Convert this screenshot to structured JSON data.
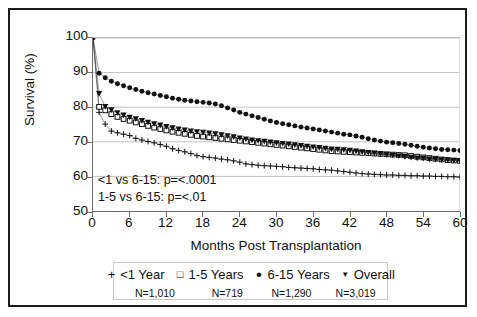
{
  "chart_data": {
    "type": "line",
    "title": "",
    "xlabel": "Months Post Transplantation",
    "ylabel": "Survival (%)",
    "xlim": [
      0,
      60
    ],
    "ylim": [
      50,
      100
    ],
    "xticks": [
      0,
      6,
      12,
      18,
      24,
      30,
      36,
      42,
      48,
      54,
      60
    ],
    "yticks": [
      50,
      60,
      70,
      80,
      90,
      100
    ],
    "grid": "horizontal",
    "legend_position": "bottom",
    "annotations": [
      "<1 vs 6-15: p=<.0001",
      "1-5 vs 6-15: p=<.01"
    ],
    "x": [
      0,
      1,
      2,
      3,
      4,
      5,
      6,
      7,
      8,
      9,
      10,
      11,
      12,
      13,
      14,
      15,
      16,
      17,
      18,
      19,
      20,
      21,
      22,
      23,
      24,
      25,
      26,
      27,
      28,
      29,
      30,
      31,
      32,
      33,
      34,
      35,
      36,
      37,
      38,
      39,
      40,
      41,
      42,
      43,
      44,
      45,
      46,
      47,
      48,
      49,
      50,
      51,
      52,
      53,
      54,
      55,
      56,
      57,
      58,
      59,
      60
    ],
    "series": [
      {
        "name": "<1 Year",
        "marker": "plus",
        "color": "#111111",
        "n_label": "N=1,010",
        "n": 1010,
        "values": [
          100,
          78.5,
          75.1,
          73.1,
          72.6,
          72.2,
          71.8,
          71.0,
          70.5,
          70.1,
          69.7,
          69.2,
          68.7,
          68.0,
          67.5,
          67.1,
          66.6,
          66.0,
          65.7,
          65.5,
          65.3,
          65.0,
          64.8,
          64.5,
          64.1,
          63.6,
          63.4,
          63.2,
          63.1,
          63.0,
          62.9,
          62.8,
          62.6,
          62.5,
          62.4,
          62.3,
          62.2,
          62.0,
          61.9,
          61.8,
          61.6,
          61.4,
          61.2,
          61.0,
          60.8,
          60.7,
          60.6,
          60.5,
          60.4,
          60.4,
          60.3,
          60.3,
          60.2,
          60.2,
          60.1,
          60.1,
          60.0,
          60.0,
          59.9,
          59.9,
          59.8
        ]
      },
      {
        "name": "1-5 Years",
        "marker": "open-square",
        "color": "#111111",
        "n_label": "N=719",
        "n": 719,
        "values": [
          100,
          80.1,
          79.1,
          78.0,
          77.2,
          76.6,
          76.1,
          75.6,
          75.1,
          74.6,
          74.1,
          73.7,
          73.3,
          72.9,
          72.6,
          72.3,
          72.0,
          71.7,
          71.5,
          71.3,
          71.1,
          70.9,
          70.7,
          70.5,
          70.3,
          70.1,
          69.9,
          69.7,
          69.5,
          69.3,
          69.1,
          68.9,
          68.7,
          68.5,
          68.3,
          68.1,
          67.9,
          67.7,
          67.5,
          67.3,
          67.2,
          67.1,
          67.0,
          66.9,
          66.8,
          66.7,
          66.6,
          66.5,
          66.4,
          66.3,
          66.2,
          66.1,
          65.9,
          65.7,
          65.5,
          65.3,
          65.1,
          64.9,
          64.7,
          64.6,
          64.5
        ]
      },
      {
        "name": "6-15 Years",
        "marker": "filled-circle",
        "color": "#111111",
        "n_label": "N=1,290",
        "n": 1290,
        "values": [
          100,
          89.8,
          88.5,
          87.5,
          86.8,
          86.2,
          85.6,
          85.1,
          84.6,
          84.2,
          83.8,
          83.4,
          83.0,
          82.6,
          82.3,
          82.0,
          81.8,
          81.6,
          81.4,
          81.2,
          80.9,
          80.4,
          79.8,
          79.2,
          78.5,
          78.0,
          77.5,
          77.0,
          76.5,
          76.0,
          75.6,
          75.2,
          74.9,
          74.6,
          74.3,
          74.0,
          73.7,
          73.4,
          73.1,
          72.8,
          72.5,
          72.2,
          72.0,
          71.7,
          71.3,
          70.9,
          70.5,
          70.2,
          69.9,
          69.7,
          69.5,
          69.3,
          69.0,
          68.7,
          68.4,
          68.2,
          68.0,
          67.8,
          67.7,
          67.6,
          67.5
        ]
      },
      {
        "name": "Overall",
        "marker": "filled-triangle-down",
        "color": "#111111",
        "n_label": "N=3,019",
        "n": 3019,
        "values": [
          100,
          83.9,
          80.2,
          79.2,
          78.4,
          77.7,
          77.1,
          76.6,
          76.1,
          75.6,
          75.2,
          74.8,
          74.4,
          74.0,
          73.7,
          73.4,
          73.1,
          72.9,
          72.7,
          72.5,
          72.3,
          72.0,
          71.7,
          71.4,
          71.1,
          70.8,
          70.5,
          70.3,
          70.1,
          69.9,
          69.7,
          69.5,
          69.3,
          69.1,
          68.9,
          68.7,
          68.5,
          68.3,
          68.1,
          67.9,
          67.8,
          67.7,
          67.5,
          67.3,
          67.1,
          66.9,
          66.7,
          66.5,
          66.3,
          66.1,
          65.9,
          65.7,
          65.5,
          65.3,
          65.2,
          65.0,
          64.9,
          64.8,
          64.7,
          64.6,
          64.5
        ]
      }
    ]
  },
  "axis": {
    "ylabel": "Survival (%)",
    "xlabel": "Months Post Transplantation",
    "yticks": [
      "100",
      "90",
      "80",
      "70",
      "60",
      "50"
    ],
    "xticks": [
      "0",
      "6",
      "12",
      "18",
      "24",
      "30",
      "36",
      "42",
      "48",
      "54",
      "60"
    ]
  },
  "annotations": {
    "line1": "<1 vs 6-15: p=<.0001",
    "line2": "1-5 vs 6-15: p=<.01"
  },
  "legend": {
    "items": [
      {
        "glyph": "+",
        "label": "<1 Year",
        "n_label": "N=1,010"
      },
      {
        "glyph": "□",
        "label": "1-5 Years",
        "n_label": "N=719"
      },
      {
        "glyph": "•",
        "label": "6-15 Years",
        "n_label": "N=1,290"
      },
      {
        "glyph": "▼",
        "label": "Overall",
        "n_label": "N=3,019"
      }
    ]
  },
  "colors": {
    "ink": "#111111",
    "grid": "#b9b9b9",
    "axis": "#6d6d6d",
    "frame": "#1b1b1b"
  }
}
